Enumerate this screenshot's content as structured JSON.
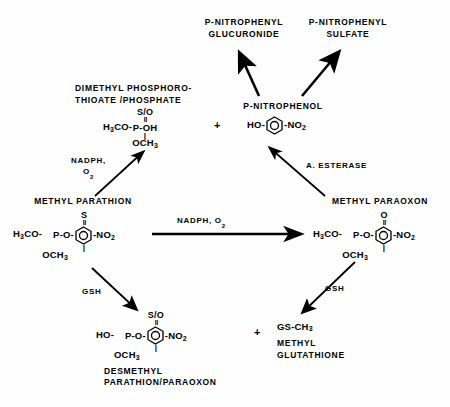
{
  "diagram": {
    "type": "reaction-scheme",
    "background_color": "#fefefe",
    "line_color": "#000000"
  },
  "nodes": {
    "p_nitrophenyl_glucuronide": {
      "name_line1": "P-NITROPHENYL",
      "name_line2": "GLUCURONIDE"
    },
    "p_nitrophenyl_sulfate": {
      "name_line1": "P-NITROPHENYL",
      "name_line2": "SULFATE"
    },
    "dimethyl_phosphorothioate": {
      "name_line1": "DIMETHYL PHOSPHORO-",
      "name_line2": "THIOATE /PHOSPHATE",
      "formula": {
        "top_atom": "S/O",
        "double_bond": "||",
        "left": "H",
        "left_sub": "3",
        "left_rest": "CO-",
        "center": "P",
        "right": "-OH",
        "single_bond": "|",
        "bottom": "OCH",
        "bottom_sub": "3"
      }
    },
    "p_nitrophenol": {
      "name": "P-NITROPHENOL",
      "formula": {
        "left": "HO-",
        "ring": "benzene-ring",
        "right": "-NO",
        "right_sub": "2"
      }
    },
    "methyl_parathion": {
      "name": "METHYL PARATHION",
      "formula": {
        "top_atom": "S",
        "double_bond": "||",
        "left": "H",
        "left_sub": "3",
        "left_rest": "CO-",
        "center": "P",
        "right": "-O-",
        "ring": "benzene-ring",
        "tail": "-NO",
        "tail_sub": "2",
        "single_bond": "|",
        "bottom": "OCH",
        "bottom_sub": "3"
      }
    },
    "methyl_paraoxon": {
      "name": "METHYL PARAOXON",
      "formula": {
        "top_atom": "O",
        "double_bond": "||",
        "left": "H",
        "left_sub": "3",
        "left_rest": "CO-",
        "center": "P",
        "right": "-O-",
        "ring": "benzene-ring",
        "tail": "-NO",
        "tail_sub": "2",
        "single_bond": "|",
        "bottom": "OCH",
        "bottom_sub": "3"
      }
    },
    "desmethyl": {
      "name_line1": "DESMETHYL",
      "name_line2": "PARATHION/PARAOXON",
      "formula": {
        "top_atom": "S/O",
        "double_bond": "||",
        "left": "HO-",
        "center": "P",
        "right": "-O-",
        "ring": "benzene-ring",
        "tail": "-NO",
        "tail_sub": "2",
        "single_bond": "|",
        "bottom": "OCH",
        "bottom_sub": "3"
      }
    },
    "methyl_glutathione": {
      "formula_left": "GS-CH",
      "formula_sub": "3",
      "name_line1": "METHYL",
      "name_line2": "GLUTATHIONE"
    }
  },
  "plus_signs": {
    "upper": "+",
    "lower": "+"
  },
  "edge_labels": {
    "nadph_o2_up_line1": "NADPH,",
    "nadph_o2_up_line2": "O",
    "nadph_o2_up_line2_sub": "2",
    "nadph_o2_horizontal": "NADPH,  O",
    "nadph_o2_horizontal_sub": "2",
    "a_esterase": "A. ESTERASE",
    "gsh_left": "GSH",
    "gsh_right": "GSH"
  },
  "arrows": [
    {
      "name": "arrow-p-nitrophenol-to-glucuronide",
      "from": "p_nitrophenol",
      "to": "p_nitrophenyl_glucuronide",
      "style": "thick"
    },
    {
      "name": "arrow-p-nitrophenol-to-sulfate",
      "from": "p_nitrophenol",
      "to": "p_nitrophenyl_sulfate",
      "style": "thick"
    },
    {
      "name": "arrow-methyl-parathion-to-dimethyl-phosphorothioate",
      "from": "methyl_parathion",
      "to": "dimethyl_phosphorothioate",
      "label": "NADPH, O2",
      "style": "thin"
    },
    {
      "name": "arrow-methyl-paraoxon-to-p-nitrophenol",
      "from": "methyl_paraoxon",
      "to": "p_nitrophenol",
      "label": "A. ESTERASE",
      "style": "thin"
    },
    {
      "name": "arrow-methyl-parathion-to-methyl-paraoxon",
      "from": "methyl_parathion",
      "to": "methyl_paraoxon",
      "label": "NADPH, O2",
      "style": "thick-horizontal"
    },
    {
      "name": "arrow-methyl-parathion-to-desmethyl",
      "from": "methyl_parathion",
      "to": "desmethyl",
      "label": "GSH",
      "style": "thin"
    },
    {
      "name": "arrow-methyl-paraoxon-to-methyl-glutathione",
      "from": "methyl_paraoxon",
      "to": "methyl_glutathione",
      "label": "GSH",
      "style": "thin"
    }
  ]
}
